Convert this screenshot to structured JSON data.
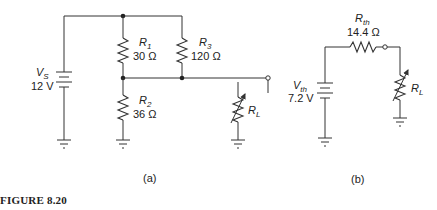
{
  "figure": {
    "caption": "FIGURE 8.20",
    "subfigures": [
      {
        "id": "a",
        "label": "(a)",
        "components": {
          "source": {
            "symbol": "V",
            "subscript": "S",
            "value": "12 V"
          },
          "r1": {
            "symbol": "R",
            "subscript": "1",
            "value": "30 Ω"
          },
          "r2": {
            "symbol": "R",
            "subscript": "2",
            "value": "36 Ω"
          },
          "r3": {
            "symbol": "R",
            "subscript": "3",
            "value": "120 Ω"
          },
          "load": {
            "symbol": "R",
            "subscript": "L",
            "value": ""
          }
        }
      },
      {
        "id": "b",
        "label": "(b)",
        "components": {
          "source": {
            "symbol": "V",
            "subscript": "th",
            "value": "7.2 V"
          },
          "rth": {
            "symbol": "R",
            "subscript": "th",
            "value": "14.4 Ω"
          },
          "load": {
            "symbol": "R",
            "subscript": "L",
            "value": ""
          }
        }
      }
    ]
  },
  "colors": {
    "line": "#333333",
    "text": "#222222",
    "background": "#ffffff"
  }
}
